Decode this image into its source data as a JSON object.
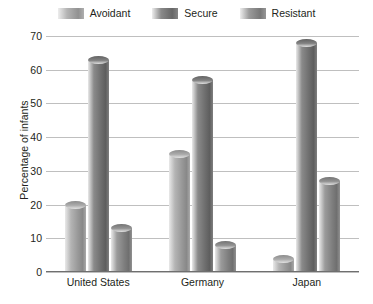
{
  "chart_data": {
    "type": "bar",
    "title": "",
    "xlabel": "",
    "ylabel": "Percentage of infants",
    "categories": [
      "United States",
      "Germany",
      "Japan"
    ],
    "ylim": [
      0,
      70
    ],
    "yticks": [
      0,
      10,
      20,
      30,
      40,
      50,
      60,
      70
    ],
    "grid": true,
    "legend_position": "top",
    "series": [
      {
        "name": "Avoidant",
        "values": [
          20,
          35,
          4
        ],
        "color": "#b4b4b4"
      },
      {
        "name": "Secure",
        "values": [
          63,
          57,
          68
        ],
        "color": "#8a8a8a"
      },
      {
        "name": "Resistant",
        "values": [
          13,
          8,
          27
        ],
        "color": "#9b9b9b"
      }
    ]
  },
  "legend": {
    "items": [
      {
        "label": "Avoidant"
      },
      {
        "label": "Secure"
      },
      {
        "label": "Resistant"
      }
    ]
  },
  "axes": {
    "y_title": "Percentage of infants",
    "y_tick_labels": [
      "70",
      "60",
      "50",
      "40",
      "30",
      "20",
      "10",
      "0"
    ],
    "x_tick_labels": [
      "United States",
      "Germany",
      "Japan"
    ]
  },
  "colors": {
    "grid": "#bfbfbf",
    "axis": "#6f6f6f",
    "text": "#231f20",
    "background": "#ffffff"
  }
}
